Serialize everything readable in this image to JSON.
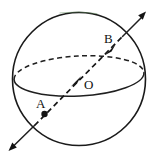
{
  "figure": {
    "type": "geometry-diagram",
    "canvas": {
      "width": 154,
      "height": 160,
      "background": "#ffffff"
    },
    "colors": {
      "ink": "#1a1a1a",
      "dashed_ink": "#1f1f1f",
      "label_ink": "#111111",
      "top_arc_tint": "#5f8a5c",
      "background": "#ffffff"
    },
    "labels": {
      "point_a": "A",
      "point_b": "B",
      "center_o": "O"
    },
    "label_positions": {
      "point_a": {
        "x": 36,
        "y": 108
      },
      "point_b": {
        "x": 104,
        "y": 43
      },
      "center_o": {
        "x": 84,
        "y": 89
      }
    },
    "shapes": {
      "sphere_outline": {
        "name": "sphere-circle",
        "cx": 79,
        "cy": 79,
        "r": 66.5,
        "style": "solid"
      },
      "equator_ellipse": {
        "name": "equator-ellipse",
        "cx": 79,
        "cy": 76,
        "rx": 65,
        "ry": 20,
        "rotation_deg": -3,
        "back_half_style": "dashed",
        "front_half_style": "solid"
      },
      "axis_line": {
        "name": "diameter-line",
        "from": {
          "x": 8,
          "y": 150
        },
        "to": {
          "x": 146,
          "y": 10
        },
        "inside_style": "dashed",
        "outside_style": "solid",
        "arrow_start": true,
        "arrow_end": true
      }
    },
    "markers": [
      {
        "name": "point-a-dot",
        "kind": "filled-dot",
        "x": 44.5,
        "y": 114,
        "r": 3.1
      },
      {
        "name": "arrowhead-at-center",
        "kind": "filled-arrowhead",
        "x": 76,
        "y": 81,
        "angle_deg": -45
      },
      {
        "name": "arrowhead-at-b",
        "kind": "filled-arrowhead",
        "x": 110,
        "y": 49,
        "angle_deg": -45
      }
    ]
  }
}
